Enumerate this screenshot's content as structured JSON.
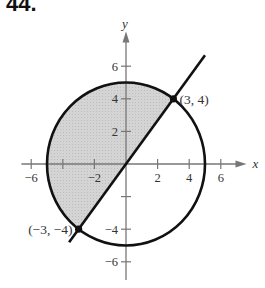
{
  "problem": {
    "number": "44."
  },
  "chart_data": {
    "type": "diagram",
    "title": "",
    "xlabel": "x",
    "ylabel": "y",
    "xlim": [
      -7,
      7.5
    ],
    "ylim": [
      -7,
      8
    ],
    "x_ticks": [
      {
        "value": -6,
        "label": "−6"
      },
      {
        "value": -4,
        "label": ""
      },
      {
        "value": -2,
        "label": "−2"
      },
      {
        "value": 2,
        "label": "2"
      },
      {
        "value": 4,
        "label": "4"
      },
      {
        "value": 6,
        "label": "6"
      }
    ],
    "y_ticks": [
      {
        "value": 6,
        "label": "6"
      },
      {
        "value": 4,
        "label": "4"
      },
      {
        "value": 2,
        "label": "2"
      },
      {
        "value": -2,
        "label": ""
      },
      {
        "value": -4,
        "label": "−4"
      },
      {
        "value": -6,
        "label": "−6"
      }
    ],
    "curves": [
      {
        "kind": "circle",
        "equation": "x^2 + y^2 = 25",
        "center": [
          0,
          0
        ],
        "radius": 5
      },
      {
        "kind": "line",
        "equation": "y = 4x/3",
        "from": [
          -3.6,
          -4.8
        ],
        "to": [
          5,
          6.67
        ]
      }
    ],
    "shaded_region": "Region inside circle, above/left of line y = 4x/3",
    "points": [
      {
        "x": 3,
        "y": 4,
        "label": "(3, 4)"
      },
      {
        "x": -3,
        "y": -4,
        "label": "(−3, −4)"
      }
    ],
    "colors": {
      "curve": "#111111",
      "axis": "#777777",
      "shade": "#cfcfcf"
    }
  }
}
